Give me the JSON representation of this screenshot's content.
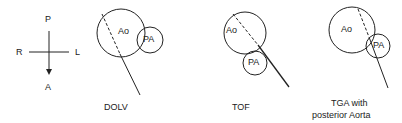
{
  "orientation": {
    "posterior": "P",
    "anterior": "A",
    "right": "R",
    "left": "L"
  },
  "panels": [
    {
      "caption": "DOLV",
      "aorta_label": "Ao",
      "pa_label": "PA"
    },
    {
      "caption": "TOF",
      "aorta_label": "Ao",
      "pa_label": "PA"
    },
    {
      "caption_line1": "TGA with",
      "caption_line2": "posterior Aorta",
      "aorta_label": "Ao",
      "pa_label": "PA"
    }
  ],
  "colors": {
    "stroke": "#222222",
    "background": "#ffffff"
  }
}
